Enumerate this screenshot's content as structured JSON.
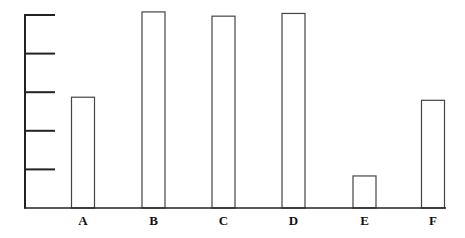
{
  "chart_data": {
    "type": "bar",
    "title": "",
    "xlabel": "",
    "ylabel": "",
    "categories": [
      "A",
      "B",
      "C",
      "D",
      "E",
      "F"
    ],
    "values": [
      2.87,
      5.08,
      4.97,
      5.04,
      0.83,
      2.79
    ],
    "ylim": [
      0,
      5
    ],
    "yticks": [
      1,
      2,
      3,
      4,
      5
    ],
    "ytick_labels_shown": false,
    "grid": false,
    "legend": null,
    "bar_fill": "#ffffff",
    "bar_stroke": "#444444",
    "axis_color": "#222222"
  }
}
